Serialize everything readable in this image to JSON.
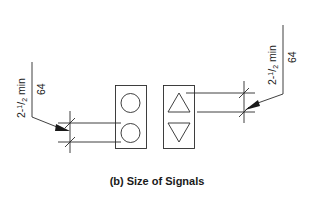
{
  "figure": {
    "caption": "(b) Size of Signals",
    "left_dimension": {
      "label_imperial_whole": "2-",
      "label_imperial_num": "1",
      "label_imperial_den": "2",
      "label_imperial_suffix": " min",
      "label_metric": "64"
    },
    "right_dimension": {
      "label_imperial_whole": "2-",
      "label_imperial_num": "1",
      "label_imperial_den": "2",
      "label_imperial_suffix": " min",
      "label_metric": "64"
    },
    "signals": [
      {
        "name": "circle-lantern",
        "shapes": [
          "circle",
          "circle"
        ]
      },
      {
        "name": "arrow-lantern",
        "shapes": [
          "triangle-up",
          "triangle-down"
        ]
      }
    ],
    "colors": {
      "line": "#2a2a2a",
      "background": "#ffffff"
    }
  }
}
